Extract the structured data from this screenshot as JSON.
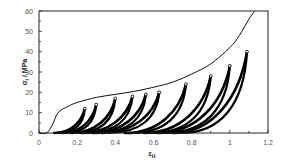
{
  "chart_data": {
    "type": "line",
    "title": "",
    "xlabel": "ε_H",
    "ylabel": "σ_l / MPa",
    "xlim": [
      0,
      1.2
    ],
    "ylim": [
      0,
      60
    ],
    "x_ticks": [
      "0",
      "0.2",
      "0.4",
      "0.6",
      "0.8",
      "1",
      "1.2"
    ],
    "y_ticks": [
      "0",
      "10",
      "20",
      "30",
      "40",
      "50",
      "60"
    ],
    "grid": false,
    "legend": null,
    "series": [
      {
        "name": "envelope (monotonic loading)",
        "style": "thin line",
        "x": [
          0.0,
          0.04,
          0.07,
          0.1,
          0.15,
          0.2,
          0.3,
          0.4,
          0.5,
          0.6,
          0.7,
          0.8,
          0.9,
          1.0,
          1.05,
          1.1,
          1.13
        ],
        "y": [
          0,
          0,
          4,
          10,
          13,
          15,
          17.5,
          19,
          20.5,
          22.5,
          25,
          29,
          34,
          42,
          48,
          56,
          60
        ]
      },
      {
        "name": "cyclic loops (peak points)",
        "style": "thick marker curves",
        "loops": [
          {
            "start": 0.08,
            "peak_x": 0.24,
            "peak_y": 12
          },
          {
            "start": 0.12,
            "peak_x": 0.3,
            "peak_y": 14
          },
          {
            "start": 0.17,
            "peak_x": 0.4,
            "peak_y": 17
          },
          {
            "start": 0.22,
            "peak_x": 0.49,
            "peak_y": 18
          },
          {
            "start": 0.28,
            "peak_x": 0.56,
            "peak_y": 19
          },
          {
            "start": 0.33,
            "peak_x": 0.63,
            "peak_y": 20
          },
          {
            "start": 0.45,
            "peak_x": 0.77,
            "peak_y": 24
          },
          {
            "start": 0.55,
            "peak_x": 0.9,
            "peak_y": 28
          },
          {
            "start": 0.62,
            "peak_x": 1.0,
            "peak_y": 33
          },
          {
            "start": 0.7,
            "peak_x": 1.09,
            "peak_y": 40
          }
        ]
      }
    ]
  },
  "axes": {
    "x_label_main": "ε",
    "x_label_sub": "H",
    "y_label_main": "σ",
    "y_label_sub": "l",
    "y_label_unit": " / MPa"
  },
  "colors": {
    "line": "#111111",
    "loops": "#000000",
    "tick_text": "#555555"
  }
}
